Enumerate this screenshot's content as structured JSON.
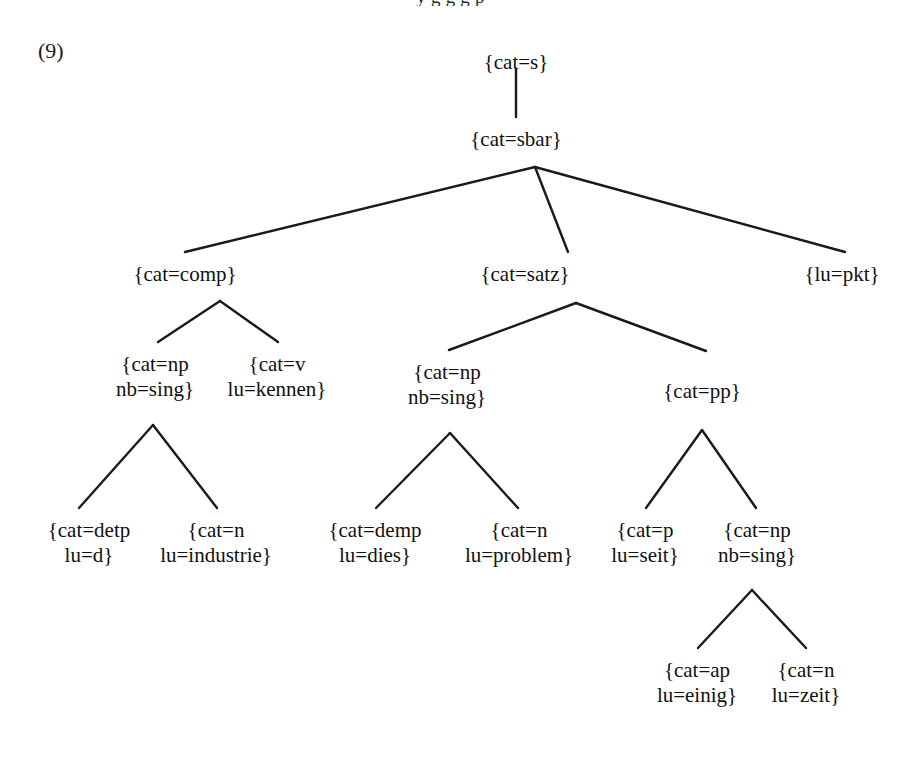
{
  "figure": {
    "example_number": "(9)",
    "cropped_top_text": "y                              g   g  g   p",
    "line_color": "#1a1a1a",
    "text_color": "#111111",
    "background_color": "#ffffff"
  },
  "tree": {
    "nodes": [
      {
        "id": "s",
        "line1": "{cat=s}",
        "line2": "",
        "x": 516,
        "y": 50,
        "twoline": false
      },
      {
        "id": "sbar",
        "line1": "{cat=sbar}",
        "line2": "",
        "x": 516,
        "y": 127,
        "twoline": false
      },
      {
        "id": "comp",
        "line1": "{cat=comp}",
        "line2": "",
        "x": 185,
        "y": 262,
        "twoline": false
      },
      {
        "id": "satz",
        "line1": "{cat=satz}",
        "line2": "",
        "x": 525,
        "y": 262,
        "twoline": false
      },
      {
        "id": "pkt",
        "line1": "{lu=pkt}",
        "line2": "",
        "x": 842,
        "y": 262,
        "twoline": false
      },
      {
        "id": "np1",
        "line1": "{cat=np",
        "line2": "nb=sing}",
        "x": 155,
        "y": 352,
        "twoline": true
      },
      {
        "id": "v",
        "line1": "{cat=v",
        "line2": "lu=kennen}",
        "x": 277,
        "y": 352,
        "twoline": true
      },
      {
        "id": "np2",
        "line1": "{cat=np",
        "line2": "nb=sing}",
        "x": 447,
        "y": 360,
        "twoline": true
      },
      {
        "id": "pp",
        "line1": "{cat=pp}",
        "line2": "",
        "x": 702,
        "y": 379,
        "twoline": false
      },
      {
        "id": "detp",
        "line1": "{cat=detp",
        "line2": "lu=d}",
        "x": 89,
        "y": 518,
        "twoline": true
      },
      {
        "id": "n1",
        "line1": "{cat=n",
        "line2": "lu=industrie}",
        "x": 216,
        "y": 518,
        "twoline": true
      },
      {
        "id": "demp",
        "line1": "{cat=demp",
        "line2": "lu=dies}",
        "x": 375,
        "y": 518,
        "twoline": true
      },
      {
        "id": "n2",
        "line1": "{cat=n",
        "line2": "lu=problem}",
        "x": 519,
        "y": 518,
        "twoline": true
      },
      {
        "id": "p",
        "line1": "{cat=p",
        "line2": "lu=seit}",
        "x": 645,
        "y": 518,
        "twoline": true
      },
      {
        "id": "np3",
        "line1": "{cat=np",
        "line2": "nb=sing}",
        "x": 757,
        "y": 518,
        "twoline": true
      },
      {
        "id": "ap",
        "line1": "{cat=ap",
        "line2": "lu=einig}",
        "x": 697,
        "y": 658,
        "twoline": true
      },
      {
        "id": "n3",
        "line1": "{cat=n",
        "line2": "lu=zeit}",
        "x": 806,
        "y": 658,
        "twoline": true
      }
    ],
    "edges": [
      {
        "from": "s",
        "to": "sbar",
        "x1": 516,
        "y1": 69,
        "x2": 516,
        "y2": 117
      },
      {
        "from": "sbar",
        "to": "comp",
        "x1": 535,
        "y1": 167,
        "x2": 185,
        "y2": 252
      },
      {
        "from": "sbar",
        "to": "satz",
        "x1": 535,
        "y1": 167,
        "x2": 568,
        "y2": 252
      },
      {
        "from": "sbar",
        "to": "pkt",
        "x1": 535,
        "y1": 167,
        "x2": 845,
        "y2": 252
      },
      {
        "from": "comp",
        "to": "np1",
        "x1": 220,
        "y1": 301,
        "x2": 158,
        "y2": 342
      },
      {
        "from": "comp",
        "to": "v",
        "x1": 220,
        "y1": 301,
        "x2": 278,
        "y2": 342
      },
      {
        "from": "satz",
        "to": "np2",
        "x1": 576,
        "y1": 303,
        "x2": 449,
        "y2": 350
      },
      {
        "from": "satz",
        "to": "pp",
        "x1": 576,
        "y1": 303,
        "x2": 706,
        "y2": 351
      },
      {
        "from": "np1",
        "to": "detp",
        "x1": 153,
        "y1": 425,
        "x2": 79,
        "y2": 508
      },
      {
        "from": "np1",
        "to": "n1",
        "x1": 153,
        "y1": 425,
        "x2": 217,
        "y2": 508
      },
      {
        "from": "np2",
        "to": "demp",
        "x1": 450,
        "y1": 433,
        "x2": 376,
        "y2": 508
      },
      {
        "from": "np2",
        "to": "n2",
        "x1": 450,
        "y1": 433,
        "x2": 518,
        "y2": 508
      },
      {
        "from": "pp",
        "to": "p",
        "x1": 702,
        "y1": 430,
        "x2": 646,
        "y2": 508
      },
      {
        "from": "pp",
        "to": "np3",
        "x1": 702,
        "y1": 430,
        "x2": 756,
        "y2": 508
      },
      {
        "from": "np3",
        "to": "ap",
        "x1": 752,
        "y1": 590,
        "x2": 698,
        "y2": 648
      },
      {
        "from": "np3",
        "to": "n3",
        "x1": 752,
        "y1": 590,
        "x2": 806,
        "y2": 648
      }
    ]
  }
}
